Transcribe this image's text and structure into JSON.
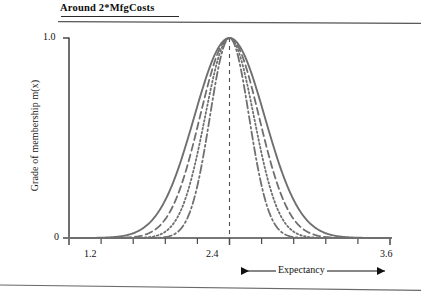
{
  "title": {
    "text": "Around 2*MfgCosts"
  },
  "axes": {
    "ylabel": "Grade of membership m(x)",
    "y_ticks": [
      "1.0",
      "0"
    ],
    "y_tick_top": "1.0",
    "y_tick_zero": "0",
    "x_tick_low": "1.2",
    "x_tick_mid": "2.4",
    "x_tick_high": "3.6"
  },
  "annotations": {
    "expectancy_label": "Expectancy"
  },
  "colors": {
    "curve": "#6f6f6f",
    "axis": "#4a4a4a",
    "text": "#111111",
    "background": "#ffffff"
  },
  "chart_data": {
    "type": "line",
    "title": "Around 2*MfgCosts",
    "xlabel": "Expectancy",
    "ylabel": "Grade of membership m(x)",
    "xlim": [
      1.2,
      3.6
    ],
    "ylim": [
      0,
      1.0
    ],
    "grid": false,
    "legend": null,
    "x_ticks": [
      1.2,
      2.4,
      3.6
    ],
    "x_minor_tick_step": 0.24,
    "y_ticks": [
      0,
      1.0
    ],
    "center": 2.4,
    "center_line": {
      "x": 2.4,
      "style": "dashed",
      "from_y": 0,
      "to_y": 1.0
    },
    "x": [
      1.2,
      1.32,
      1.44,
      1.56,
      1.68,
      1.8,
      1.92,
      2.04,
      2.16,
      2.28,
      2.4,
      2.52,
      2.64,
      2.76,
      2.88,
      3.0,
      3.12,
      3.24,
      3.36,
      3.48,
      3.6
    ],
    "series": [
      {
        "name": "widest",
        "style": "solid",
        "spread": 0.62,
        "values": [
          0.012,
          0.028,
          0.06,
          0.118,
          0.212,
          0.345,
          0.508,
          0.676,
          0.823,
          0.945,
          1.0,
          0.945,
          0.823,
          0.676,
          0.508,
          0.345,
          0.212,
          0.118,
          0.06,
          0.028,
          0.012
        ]
      },
      {
        "name": "wide",
        "style": "dashed",
        "spread": 0.52,
        "values": [
          0.003,
          0.01,
          0.028,
          0.068,
          0.145,
          0.268,
          0.435,
          0.617,
          0.789,
          0.93,
          1.0,
          0.93,
          0.789,
          0.617,
          0.435,
          0.268,
          0.145,
          0.068,
          0.028,
          0.01,
          0.003
        ]
      },
      {
        "name": "narrow",
        "style": "dotted",
        "spread": 0.43,
        "values": [
          0.0,
          0.002,
          0.009,
          0.03,
          0.085,
          0.192,
          0.361,
          0.565,
          0.76,
          0.912,
          1.0,
          0.912,
          0.76,
          0.565,
          0.361,
          0.192,
          0.085,
          0.03,
          0.009,
          0.002,
          0.0
        ]
      },
      {
        "name": "narrowest",
        "style": "dashdot",
        "spread": 0.345,
        "values": [
          0.0,
          0.0,
          0.001,
          0.007,
          0.032,
          0.105,
          0.262,
          0.492,
          0.727,
          0.902,
          1.0,
          0.902,
          0.727,
          0.492,
          0.262,
          0.105,
          0.032,
          0.007,
          0.001,
          0.0,
          0.0
        ]
      }
    ]
  }
}
